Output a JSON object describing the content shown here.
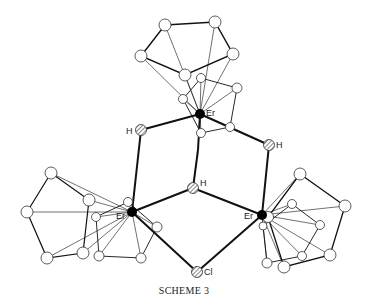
{
  "diagram": {
    "caption": "Scheme 3",
    "caption_display": "SCHEME 3",
    "atoms": {
      "er_top": {
        "label": "Er",
        "x": 200,
        "y": 114
      },
      "er_left": {
        "label": "Er",
        "x": 132,
        "y": 212
      },
      "er_right": {
        "label": "Er",
        "x": 262,
        "y": 215
      },
      "h_left": {
        "label": "H",
        "x": 141,
        "y": 130
      },
      "h_right": {
        "label": "H",
        "x": 269,
        "y": 145
      },
      "h_center": {
        "label": "H",
        "x": 193,
        "y": 188
      },
      "cl": {
        "label": "Cl",
        "x": 197,
        "y": 272
      }
    },
    "colors": {
      "metal": "#000000",
      "bond": "#111111",
      "ring_atom_fill": "#ffffff",
      "hatch": "#555555"
    }
  }
}
